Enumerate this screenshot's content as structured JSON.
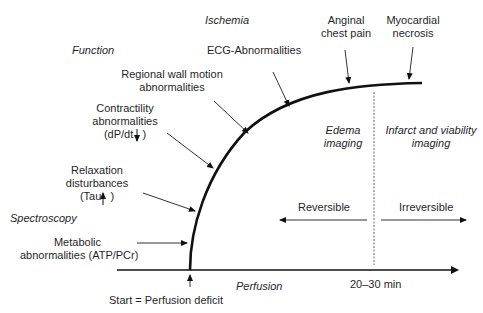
{
  "categories": {
    "ischemia": "Ischemia",
    "function": "Function",
    "spectroscopy": "Spectroscopy",
    "perfusion": "Perfusion"
  },
  "events": {
    "ecg": "ECG-Abnormalities",
    "angina_l1": "Anginal",
    "angina_l2": "chest pain",
    "necrosis_l1": "Myocardial",
    "necrosis_l2": "necrosis",
    "wall_l1": "Regional wall motion",
    "wall_l2": "abnormalities",
    "contract_l1": "Contractility",
    "contract_l2": "abnormalities",
    "contract_l3": "(dP/dt",
    "contract_l3_end": ")",
    "relax_l1": "Relaxation",
    "relax_l2": "disturbances",
    "relax_l3": "(Tau",
    "relax_l3_end": ")",
    "metabolic_l1": "Metabolic",
    "metabolic_l2": "abnormalities (ATP/PCr)",
    "start": "Start = Perfusion deficit"
  },
  "regions": {
    "edema_l1": "Edema",
    "edema_l2": "imaging",
    "infarct_l1": "Infarct and viability",
    "infarct_l2": "imaging",
    "reversible": "Reversible",
    "irreversible": "Irreversible",
    "time_mark": "20–30 min"
  },
  "colors": {
    "line": "#111111",
    "thin_arrow": "#333333",
    "dashed": "#555555"
  }
}
